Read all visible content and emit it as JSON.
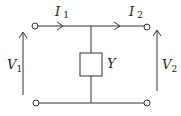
{
  "diagram": {
    "labels": {
      "I1": {
        "main": "I",
        "sub": "1"
      },
      "I2": {
        "main": "I",
        "sub": "2"
      },
      "V1": {
        "main": "V",
        "sub": "1"
      },
      "V2": {
        "main": "V",
        "sub": "2"
      },
      "Y": "Y"
    },
    "colors": {
      "line": "#333333",
      "background": "#ffffff"
    }
  }
}
